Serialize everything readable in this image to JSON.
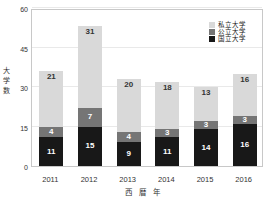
{
  "chart_data": {
    "type": "bar",
    "subtype": "stacked-bar",
    "title": "",
    "xlabel": "西 暦 年",
    "ylabel": "大学数",
    "ylabel_chars": [
      "大",
      "学",
      "数"
    ],
    "categories": [
      "2011",
      "2012",
      "2013",
      "2014",
      "2015",
      "2016"
    ],
    "ylim": [
      0,
      60
    ],
    "yticks": [
      "0",
      "15",
      "30",
      "45",
      "60"
    ],
    "ytick_values": [
      0,
      15,
      30,
      45,
      60
    ],
    "grid": true,
    "grid_axis": "y",
    "legend_position": "top-right",
    "stack_order_bottom_to_top": [
      "国立大学",
      "公立大学",
      "私立大学"
    ],
    "series": [
      {
        "name": "国立大学",
        "key": "national",
        "color": "#181818",
        "values": [
          11,
          15,
          9,
          11,
          14,
          16
        ]
      },
      {
        "name": "公立大学",
        "key": "public",
        "color": "#757575",
        "values": [
          4,
          7,
          4,
          3,
          3,
          3
        ]
      },
      {
        "name": "私立大学",
        "key": "private",
        "color": "#d9d9d9",
        "values": [
          21,
          31,
          20,
          18,
          13,
          16
        ]
      }
    ],
    "totals": [
      36,
      53,
      33,
      32,
      30,
      35
    ]
  },
  "legend": {
    "items": [
      {
        "label": "私立大学",
        "key": "private",
        "color": "#d9d9d9"
      },
      {
        "label": "公立大学",
        "key": "public",
        "color": "#757575"
      },
      {
        "label": "国立大学",
        "key": "national",
        "color": "#181818"
      }
    ]
  },
  "colors": {
    "private": "#d9d9d9",
    "public": "#757575",
    "national": "#181818",
    "grid": "#e9e9e9",
    "frame": "#c8c8c8",
    "text": "#333333",
    "background": "#ffffff"
  }
}
